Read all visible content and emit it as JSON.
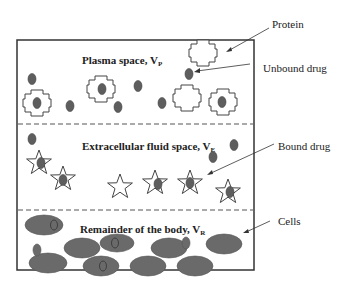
{
  "diagram": {
    "compartments": [
      {
        "name": "plasma",
        "label": "Plasma space, V",
        "subscript": "P"
      },
      {
        "name": "extracellular",
        "label": "Extracellular fluid space, V",
        "subscript": "E"
      },
      {
        "name": "remainder",
        "label": "Remainder of the body, V",
        "subscript": "R"
      }
    ],
    "callouts": {
      "protein": "Protein",
      "unbound_drug": "Unbound drug",
      "bound_drug": "Bound drug",
      "cells": "Cells"
    },
    "colors": {
      "drug_fill": "#5e5e5e",
      "cell_fill": "#6a6a6a",
      "outline": "#333333",
      "dashed": "#555555"
    }
  }
}
